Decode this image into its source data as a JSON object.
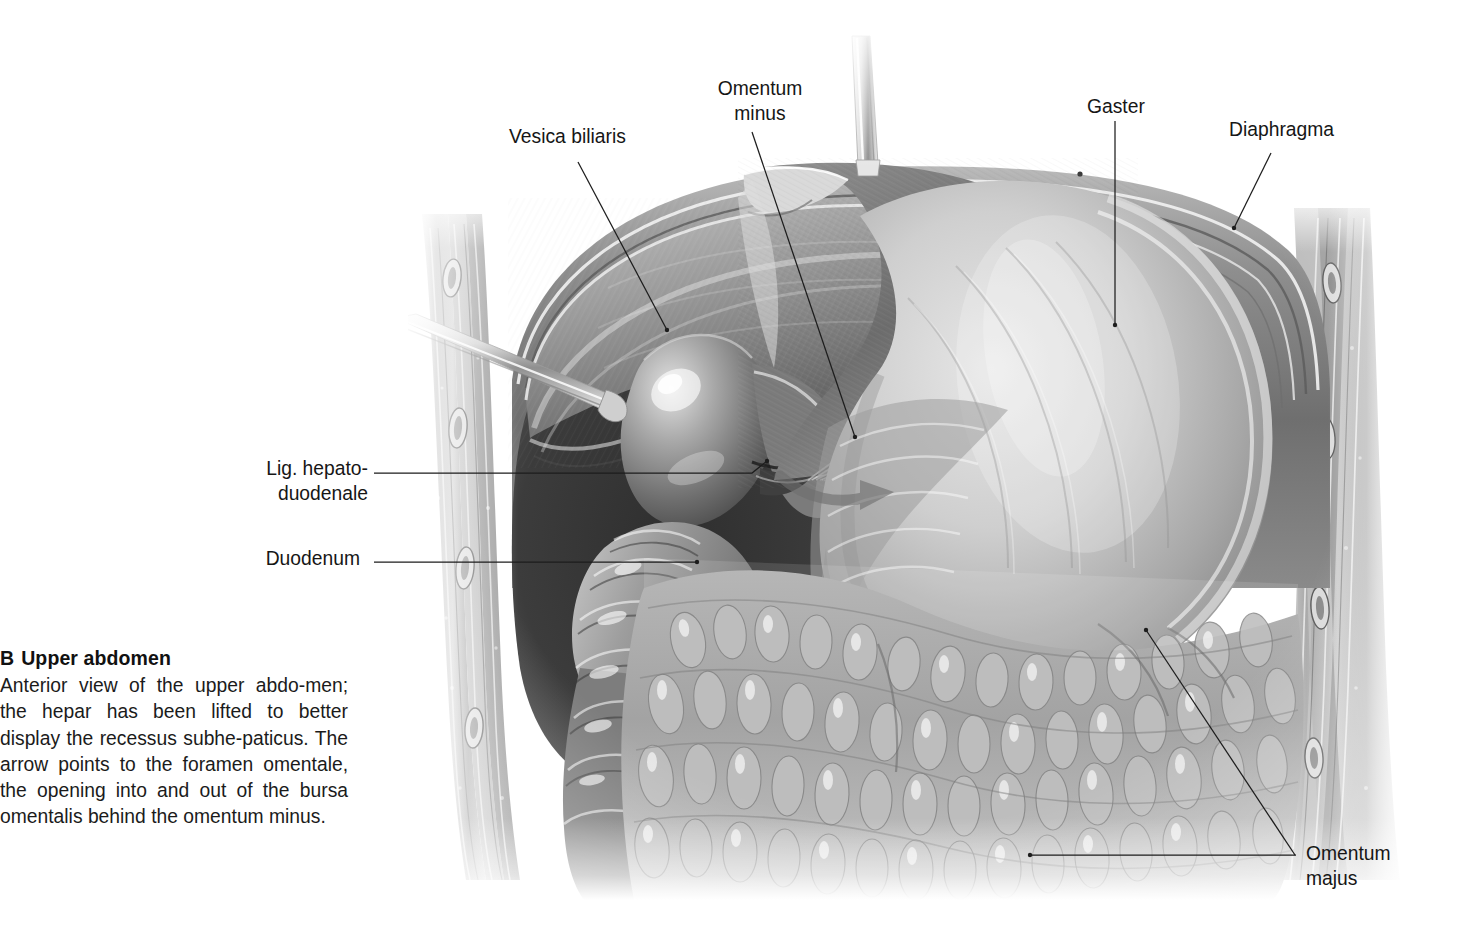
{
  "figure": {
    "letter": "B",
    "title": "Upper abdomen",
    "caption": "Anterior view of the upper abdo-men; the hepar has been lifted to better display the recessus subhe-paticus. The arrow points to the foramen omentale, the opening into and out of the bursa omentalis behind the omentum minus.",
    "type": "grayscale anatomical illustration",
    "view": "anterior view"
  },
  "labels": {
    "vesica_biliaris": "Vesica biliaris",
    "omentum_minus": "Omentum\nminus",
    "gaster": "Gaster",
    "diaphragma": "Diaphragma",
    "lig_hepatoduodenale": "Lig. hepato-\nduodenale",
    "duodenum": "Duodenum",
    "omentum_majus": "Omentum\nmajus"
  },
  "colors": {
    "text": "#161616",
    "leader": "#1d1d1d",
    "background": "#ffffff",
    "liver_dark": "#4a4a4a",
    "liver_mid": "#8d8d8d",
    "stomach_light": "#cfcfcf",
    "omentum_mid": "#a8a8a8",
    "wall_gray": "#b4b4b4"
  },
  "illustration_parts": [
    "diaphragm",
    "hepar",
    "vesica biliaris",
    "gaster",
    "omentum minus",
    "omentum majus",
    "duodenum",
    "lig. hepatoduodenale",
    "abdominal wall (left)",
    "abdominal wall (right)",
    "retractor (left)",
    "retractor (top)",
    "arrow to foramen omentale"
  ]
}
